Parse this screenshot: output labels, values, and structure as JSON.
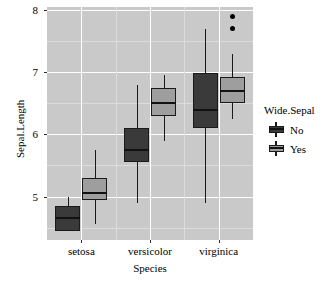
{
  "chart_data": {
    "type": "box",
    "title": "",
    "xlabel": "Species",
    "ylabel": "Sepal.Length",
    "categories": [
      "setosa",
      "versicolor",
      "virginica"
    ],
    "ylim": [
      4.3,
      8.05
    ],
    "yticks": [
      5,
      6,
      7,
      8
    ],
    "ytick_labels": [
      "5",
      "6",
      "7",
      "8"
    ],
    "grid": true,
    "legend": {
      "title": "Wide.Sepal",
      "position": "right",
      "entries": [
        {
          "label": "No",
          "color": "#3a3a3a"
        },
        {
          "label": "Yes",
          "color": "#9e9e9e"
        }
      ]
    },
    "series": [
      {
        "name": "No",
        "color": "#3a3a3a",
        "boxes": [
          {
            "category": "setosa",
            "lower_whisker": 4.6,
            "q1": 4.45,
            "median": 4.65,
            "q3": 4.85,
            "upper_whisker": 5.0,
            "outliers": []
          },
          {
            "category": "versicolor",
            "lower_whisker": 4.9,
            "q1": 5.55,
            "median": 5.75,
            "q3": 6.1,
            "upper_whisker": 6.8,
            "outliers": []
          },
          {
            "category": "virginica",
            "lower_whisker": 4.9,
            "q1": 6.1,
            "median": 6.4,
            "q3": 6.98,
            "upper_whisker": 7.7,
            "outliers": []
          }
        ]
      },
      {
        "name": "Yes",
        "color": "#9e9e9e",
        "boxes": [
          {
            "category": "setosa",
            "lower_whisker": 4.55,
            "q1": 4.95,
            "median": 5.05,
            "q3": 5.3,
            "upper_whisker": 5.75,
            "outliers": []
          },
          {
            "category": "versicolor",
            "lower_whisker": 5.9,
            "q1": 6.3,
            "median": 6.5,
            "q3": 6.75,
            "upper_whisker": 6.95,
            "outliers": []
          },
          {
            "category": "virginica",
            "lower_whisker": 6.25,
            "q1": 6.5,
            "median": 6.7,
            "q3": 6.93,
            "upper_whisker": 7.3,
            "outliers": [
              7.7,
              7.9
            ]
          }
        ]
      }
    ]
  },
  "axes": {
    "y_title": "Sepal.Length",
    "x_title": "Species"
  }
}
